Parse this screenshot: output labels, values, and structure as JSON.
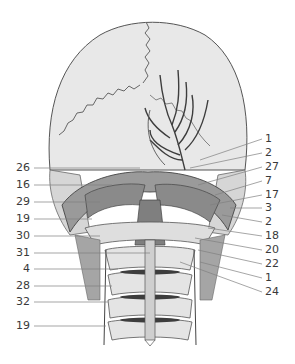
{
  "figure": {
    "colors": {
      "bone": "#e6e6e6",
      "outline": "#555555",
      "muscle": "#8a8a8a",
      "vessel": "#3d3d3d",
      "leader": "#808080",
      "label": "#3a3a3a"
    }
  },
  "labels_left": [
    {
      "text": "26",
      "y": 168,
      "tx": 140
    },
    {
      "text": "16",
      "y": 185,
      "tx": 112
    },
    {
      "text": "29",
      "y": 202,
      "tx": 100
    },
    {
      "text": "19",
      "y": 219,
      "tx": 92
    },
    {
      "text": "30",
      "y": 236,
      "tx": 100
    },
    {
      "text": "31",
      "y": 253,
      "tx": 150
    },
    {
      "text": "4",
      "y": 269,
      "tx": 118
    },
    {
      "text": "28",
      "y": 286,
      "tx": 112
    },
    {
      "text": "32",
      "y": 302,
      "tx": 108
    },
    {
      "text": "19",
      "y": 326,
      "tx": 106
    }
  ],
  "labels_right": [
    {
      "text": "1",
      "y": 139,
      "tx": 200
    },
    {
      "text": "2",
      "y": 153,
      "tx": 190
    },
    {
      "text": "27",
      "y": 167,
      "tx": 198
    },
    {
      "text": "7",
      "y": 181,
      "tx": 215
    },
    {
      "text": "17",
      "y": 195,
      "tx": 210
    },
    {
      "text": "3",
      "y": 208,
      "tx": 230
    },
    {
      "text": "2",
      "y": 222,
      "tx": 222
    },
    {
      "text": "18",
      "y": 236,
      "tx": 208
    },
    {
      "text": "20",
      "y": 250,
      "tx": 195
    },
    {
      "text": "22",
      "y": 264,
      "tx": 198
    },
    {
      "text": "1",
      "y": 278,
      "tx": 200
    },
    {
      "text": "24",
      "y": 292,
      "tx": 180
    }
  ]
}
